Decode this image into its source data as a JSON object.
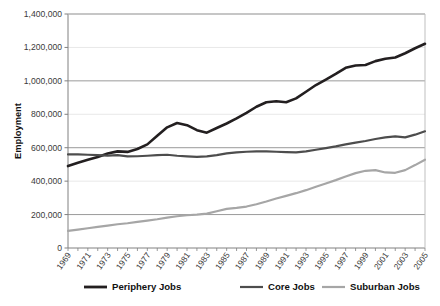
{
  "chart_data": {
    "type": "line",
    "title": "",
    "xlabel": "",
    "ylabel": "Employment",
    "ylim": [
      0,
      1400000
    ],
    "ytick_labels": [
      "0",
      "200,000",
      "400,000",
      "600,000",
      "800,000",
      "1,000,000",
      "1,200,000",
      "1,400,000"
    ],
    "ytick_values": [
      0,
      200000,
      400000,
      600000,
      800000,
      1000000,
      1200000,
      1400000
    ],
    "grid": true,
    "legend_position": "bottom",
    "x": [
      1969,
      1970,
      1971,
      1972,
      1973,
      1974,
      1975,
      1976,
      1977,
      1978,
      1979,
      1980,
      1981,
      1982,
      1983,
      1984,
      1985,
      1986,
      1987,
      1988,
      1989,
      1990,
      1991,
      1992,
      1993,
      1994,
      1995,
      1996,
      1997,
      1998,
      1999,
      2000,
      2001,
      2002,
      2003,
      2004,
      2005
    ],
    "xtick_labels": [
      "1969",
      "1971",
      "1973",
      "1975",
      "1977",
      "1979",
      "1981",
      "1983",
      "1985",
      "1987",
      "1989",
      "1991",
      "1993",
      "1995",
      "1997",
      "1999",
      "2001",
      "2003",
      "2005"
    ],
    "series": [
      {
        "name": "Periphery Jobs",
        "color": "#231f20",
        "width": 2.6,
        "values": [
          490000,
          510000,
          528000,
          545000,
          565000,
          578000,
          575000,
          592000,
          620000,
          672000,
          722000,
          748000,
          735000,
          705000,
          690000,
          718000,
          745000,
          775000,
          808000,
          845000,
          872000,
          878000,
          872000,
          895000,
          935000,
          975000,
          1008000,
          1042000,
          1078000,
          1092000,
          1095000,
          1118000,
          1132000,
          1140000,
          1165000,
          1195000,
          1222000
        ]
      },
      {
        "name": "Core Jobs",
        "color": "#4d4d4d",
        "width": 2.2,
        "values": [
          560000,
          560000,
          558000,
          556000,
          553000,
          556000,
          548000,
          549000,
          552000,
          556000,
          558000,
          552000,
          548000,
          545000,
          548000,
          556000,
          566000,
          572000,
          576000,
          578000,
          578000,
          576000,
          574000,
          572000,
          578000,
          588000,
          598000,
          608000,
          620000,
          630000,
          640000,
          652000,
          662000,
          668000,
          662000,
          678000,
          698000
        ]
      },
      {
        "name": "Suburban Jobs",
        "color": "#a6a6a6",
        "width": 2.2,
        "values": [
          102000,
          110000,
          118000,
          126000,
          134000,
          142000,
          148000,
          156000,
          164000,
          172000,
          182000,
          190000,
          196000,
          200000,
          206000,
          220000,
          234000,
          240000,
          248000,
          262000,
          278000,
          296000,
          312000,
          328000,
          346000,
          366000,
          386000,
          406000,
          428000,
          448000,
          462000,
          466000,
          452000,
          450000,
          466000,
          496000,
          528000
        ]
      }
    ]
  },
  "legend": {
    "items": [
      {
        "label": "Periphery Jobs",
        "color": "#231f20"
      },
      {
        "label": "Core Jobs",
        "color": "#4d4d4d"
      },
      {
        "label": "Suburban Jobs",
        "color": "#a6a6a6"
      }
    ]
  },
  "axis": {
    "y_title": "Employment"
  }
}
